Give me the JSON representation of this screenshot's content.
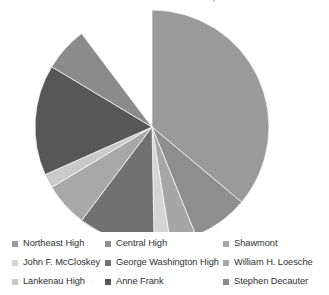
{
  "caption": {
    "text": "The chart below shows the enrollment distribution per school."
  },
  "chart_data": {
    "type": "pie",
    "title": "",
    "subtitle": "",
    "xlabel": "",
    "ylabel": "",
    "grid": false,
    "legend_position": "bottom",
    "start_angle_deg": 0,
    "direction": "clockwise",
    "center": {
      "x": 152,
      "y": 119
    },
    "radius": 117,
    "categories": [
      "Northeast High",
      "Central High",
      "Shawmont",
      "John F. McCloskey",
      "George Washington High",
      "William H. Loesche",
      "Lankenau High",
      "Anne Frank",
      "Stephen Decauter"
    ],
    "values": [
      36.1,
      7.8,
      3.6,
      2.2,
      10.6,
      6.1,
      1.9,
      15.3,
      6.1
    ],
    "units": "percent",
    "slices": [
      {
        "label": "Northeast High",
        "value": 36.1,
        "angle_deg": 130.0,
        "color": "#9a9a9a"
      },
      {
        "label": "Central High",
        "value": 7.8,
        "angle_deg": 28.0,
        "color": "#8e8e8e"
      },
      {
        "label": "Shawmont",
        "value": 3.6,
        "angle_deg": 13.0,
        "color": "#a6a6a6"
      },
      {
        "label": "John F. McCloskey",
        "value": 2.2,
        "angle_deg": 8.0,
        "color": "#d4d4d4"
      },
      {
        "label": "George Washington High",
        "value": 10.6,
        "angle_deg": 38.0,
        "color": "#717171"
      },
      {
        "label": "William H. Loesche",
        "value": 6.1,
        "angle_deg": 22.0,
        "color": "#a8a8a8"
      },
      {
        "label": "Lankenau High",
        "value": 1.9,
        "angle_deg": 7.0,
        "color": "#c9c9c9"
      },
      {
        "label": "Anne Frank",
        "value": 15.3,
        "angle_deg": 55.0,
        "color": "#575757"
      },
      {
        "label": "Stephen Decauter",
        "value": 6.1,
        "angle_deg": 22.0,
        "color": "#8b8b8b"
      }
    ]
  },
  "legend": {
    "rows": [
      [
        {
          "label": "Northeast High",
          "color": "#9a9a9a"
        },
        {
          "label": "Central High",
          "color": "#8e8e8e"
        },
        {
          "label": "Shawmont",
          "color": "#a6a6a6"
        }
      ],
      [
        {
          "label": "John F. McCloskey",
          "color": "#d4d4d4"
        },
        {
          "label": "George Washington High",
          "color": "#717171"
        },
        {
          "label": "William H. Loesche",
          "color": "#a8a8a8"
        }
      ],
      [
        {
          "label": "Lankenau High",
          "color": "#c9c9c9"
        },
        {
          "label": "Anne Frank",
          "color": "#575757"
        },
        {
          "label": "Stephen Decauter",
          "color": "#8b8b8b"
        }
      ]
    ]
  }
}
